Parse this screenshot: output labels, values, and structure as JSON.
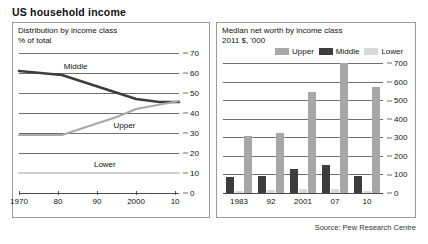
{
  "title": "US household income",
  "source": "Source: Pew Research Centre",
  "colors": {
    "upper": "#a8a8a8",
    "middle": "#3d3d3d",
    "lower": "#d8d8d8",
    "grid": "#6f6f6f",
    "border": "#9a9a9a",
    "text": "#111111"
  },
  "left_panel": {
    "title": "Distribution by income class",
    "subtitle": "% of total",
    "label_middle": "Middle",
    "label_upper": "Upper",
    "label_lower": "Lower"
  },
  "right_panel": {
    "title": "Median net worth by income class",
    "subtitle": "2011 $, '000",
    "legend": [
      {
        "key": "upper",
        "label": "Upper",
        "color": "#a8a8a8"
      },
      {
        "key": "middle",
        "label": "Middle",
        "color": "#3d3d3d"
      },
      {
        "key": "lower",
        "label": "Lower",
        "color": "#d8d8d8"
      }
    ]
  },
  "chart_data": [
    {
      "type": "line",
      "title": "Distribution by income class",
      "subtitle": "% of total",
      "xlabel": "",
      "ylabel": "% of total",
      "xlim": [
        1970,
        2011
      ],
      "ylim": [
        0,
        70
      ],
      "yticks": [
        0,
        10,
        20,
        30,
        40,
        50,
        60,
        70
      ],
      "xticks": [
        1970,
        1980,
        1990,
        2000,
        2010
      ],
      "xticklabels": [
        "1970",
        "80",
        "90",
        "2000",
        "10"
      ],
      "grid": true,
      "legend": "inline-annotations",
      "series": [
        {
          "name": "Middle",
          "color": "#3d3d3d",
          "x": [
            1970,
            1981,
            2000,
            2006,
            2011
          ],
          "values": [
            61,
            59,
            47,
            45.5,
            45.5
          ]
        },
        {
          "name": "Upper",
          "color": "#a8a8a8",
          "x": [
            1970,
            1981,
            1995,
            2000,
            2011
          ],
          "values": [
            29,
            29,
            38,
            42,
            46
          ]
        },
        {
          "name": "Lower",
          "color": "#cfcfcf",
          "x": [
            1970,
            1981,
            2000,
            2011
          ],
          "values": [
            10,
            10,
            10,
            10
          ]
        }
      ]
    },
    {
      "type": "bar",
      "title": "Median net worth by income class",
      "subtitle": "2011 $, '000",
      "xlabel": "",
      "ylabel": "2011 $, '000",
      "categories": [
        "1983",
        "92",
        "2001",
        "07",
        "10"
      ],
      "ylim": [
        0,
        700
      ],
      "yticks": [
        0,
        100,
        200,
        300,
        400,
        500,
        600,
        700
      ],
      "grid": true,
      "legend_position": "top",
      "series": [
        {
          "name": "Middle",
          "color": "#3d3d3d",
          "values": [
            88,
            90,
            130,
            152,
            93
          ]
        },
        {
          "name": "Lower",
          "color": "#d8d8d8",
          "values": [
            12,
            16,
            20,
            21,
            12
          ]
        },
        {
          "name": "Upper",
          "color": "#a8a8a8",
          "values": [
            305,
            322,
            545,
            700,
            570
          ]
        }
      ]
    }
  ]
}
